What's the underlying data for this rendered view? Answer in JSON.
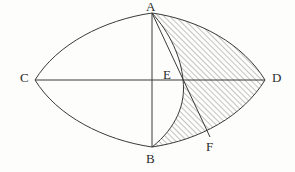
{
  "figure": {
    "kind": "geometry-diagram",
    "background_color": "#fdfdfc",
    "stroke_color": "#3a3a3a",
    "hatch_color": "#555555",
    "label_color": "#2b2b2b",
    "width": 295,
    "height": 172
  },
  "points": [
    {
      "id": "A",
      "label": "A",
      "x": 152,
      "y": 13,
      "label_x": 146,
      "label_y": 0,
      "role": "top-vertex"
    },
    {
      "id": "B",
      "label": "B",
      "x": 152,
      "y": 147,
      "label_x": 146,
      "label_y": 152,
      "role": "bottom-vertex"
    },
    {
      "id": "C",
      "label": "C",
      "x": 35,
      "y": 80,
      "label_x": 20,
      "label_y": 71,
      "role": "left-vertex"
    },
    {
      "id": "D",
      "label": "D",
      "x": 265,
      "y": 80,
      "label_x": 272,
      "label_y": 71,
      "role": "right-vertex"
    },
    {
      "id": "E",
      "label": "E",
      "x": 183,
      "y": 80,
      "label_x": 163,
      "label_y": 68,
      "role": "arc-axis-intersection"
    },
    {
      "id": "F",
      "label": "F",
      "x": 210,
      "y": 137,
      "label_x": 206,
      "label_y": 140,
      "role": "chord-arc-intersection"
    }
  ],
  "segments": [
    {
      "id": "CD",
      "from": "C",
      "to": "D",
      "type": "line",
      "note": "horizontal axis"
    },
    {
      "id": "AB",
      "from": "A",
      "to": "B",
      "type": "line",
      "note": "vertical axis"
    },
    {
      "id": "AF",
      "from": "A",
      "to": "F",
      "type": "line",
      "note": "chord through E"
    }
  ],
  "arcs": [
    {
      "id": "CA",
      "from": "C",
      "to": "A",
      "note": "upper-left boundary of lens"
    },
    {
      "id": "AD",
      "from": "A",
      "to": "D",
      "note": "upper-right boundary of lens"
    },
    {
      "id": "CB",
      "from": "C",
      "to": "B",
      "note": "lower-left boundary of lens"
    },
    {
      "id": "BD",
      "from": "B",
      "to": "D",
      "note": "lower-right boundary of lens, passes through F"
    },
    {
      "id": "AEB",
      "from": "A",
      "to": "B",
      "note": "inner arc bulging right, passes through E"
    }
  ],
  "shaded_region": {
    "id": "AEBDA",
    "fill": "diagonal-hatch",
    "hatch_angle_deg": 45,
    "hatch_spacing_px": 4,
    "boundary": [
      "arc AEB",
      "arc BD",
      "arc DA"
    ]
  }
}
